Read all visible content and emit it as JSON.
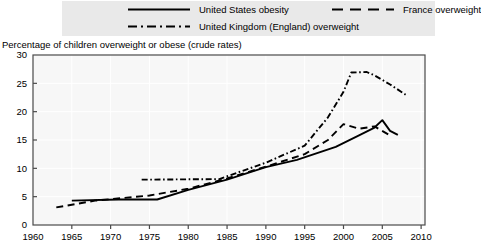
{
  "legend": {
    "background_color": "#e9e9e9",
    "entries": [
      {
        "label": "United States obesity",
        "style": "solid",
        "icon": "solid-line-icon"
      },
      {
        "label": "United Kingdom (England) overweight",
        "style": "dash-dot",
        "icon": "dash-dot-line-icon"
      },
      {
        "label": "France overweight",
        "style": "dashed",
        "icon": "dashed-line-icon"
      }
    ]
  },
  "axis_title": "Percentage of children overweight or obese (crude rates)",
  "chart_data": {
    "type": "line",
    "title": "",
    "subtitle": "",
    "xlabel": "",
    "ylabel": "Percentage of children overweight or obese (crude rates)",
    "xlim": [
      1960,
      2010.5
    ],
    "ylim": [
      0,
      30
    ],
    "xticks": [
      1960,
      1965,
      1970,
      1975,
      1980,
      1985,
      1990,
      1995,
      2000,
      2005,
      2010
    ],
    "yticks": [
      0,
      5,
      10,
      15,
      20,
      25,
      30
    ],
    "xtick_labels": [
      "1960",
      "1965",
      "1970",
      "1975",
      "1980",
      "1985",
      "1990",
      "1995",
      "2000",
      "2005",
      "2010"
    ],
    "ytick_labels": [
      "0",
      "5",
      "10",
      "15",
      "20",
      "25",
      "30"
    ],
    "grid": true,
    "legend_position": "top",
    "line_color": "#000000",
    "series": [
      {
        "name": "United States obesity",
        "style": "solid",
        "points": [
          [
            1965,
            4.3
          ],
          [
            1971,
            4.5
          ],
          [
            1976,
            4.5
          ],
          [
            1980,
            6.2
          ],
          [
            1985,
            8.0
          ],
          [
            1990,
            10.2
          ],
          [
            1994,
            11.5
          ],
          [
            1999,
            13.8
          ],
          [
            2002,
            15.8
          ],
          [
            2004,
            17.2
          ],
          [
            2005,
            18.5
          ],
          [
            2006,
            16.6
          ],
          [
            2007,
            15.9
          ]
        ]
      },
      {
        "name": "United Kingdom (England) overweight",
        "style": "dash-dot",
        "points": [
          [
            1974,
            8.0
          ],
          [
            1984,
            8.1
          ],
          [
            1990,
            11.0
          ],
          [
            1995,
            14.0
          ],
          [
            1998,
            19.0
          ],
          [
            2000,
            23.5
          ],
          [
            2001,
            26.9
          ],
          [
            2003,
            27.0
          ],
          [
            2004,
            26.4
          ],
          [
            2006,
            24.8
          ],
          [
            2008,
            23.0
          ]
        ]
      },
      {
        "name": "France overweight",
        "style": "dashed",
        "points": [
          [
            1963,
            3.1
          ],
          [
            1968,
            4.3
          ],
          [
            1975,
            5.2
          ],
          [
            1980,
            6.4
          ],
          [
            1985,
            8.2
          ],
          [
            1990,
            10.3
          ],
          [
            1995,
            12.5
          ],
          [
            1998,
            15.0
          ],
          [
            2000,
            17.8
          ],
          [
            2002,
            17.0
          ],
          [
            2004,
            17.4
          ],
          [
            2006,
            15.8
          ]
        ]
      }
    ]
  }
}
